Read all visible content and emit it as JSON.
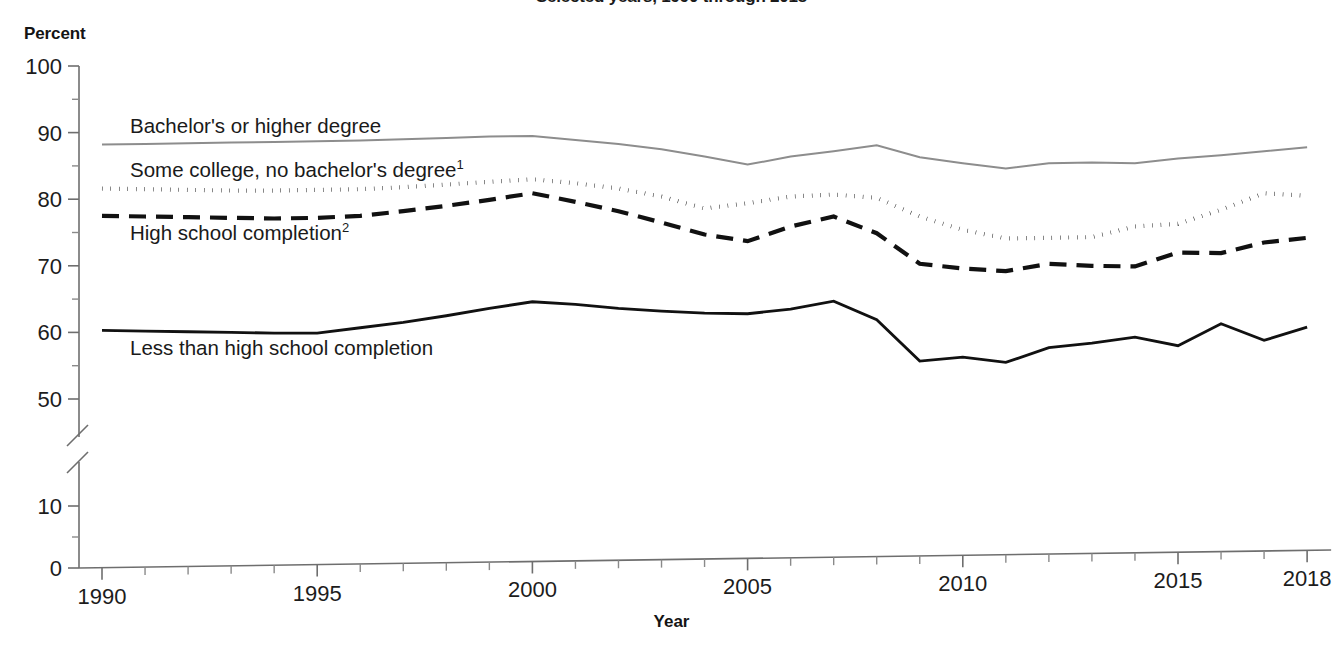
{
  "title": "Selected years, 1990 through 2018",
  "axis": {
    "y_unit_label": "Percent",
    "x_title": "Year",
    "y_ticks": [
      "100",
      "90",
      "80",
      "70",
      "60",
      "50",
      "10",
      "0"
    ],
    "x_ticks": [
      "1990",
      "1995",
      "2000",
      "2005",
      "2010",
      "2015",
      "2018"
    ],
    "y_axis_break": true
  },
  "series_labels": {
    "bachelors": "Bachelor's or higher degree",
    "some_college": "Some college, no bachelor's degree",
    "some_college_sup": "1",
    "high_school": "High school completion",
    "high_school_sup": "2",
    "less_than_hs": "Less than high school completion"
  },
  "colors": {
    "bachelors": "#8d8d8d",
    "some_college": "#111111",
    "high_school": "#111111",
    "less_than_hs": "#111111",
    "axis": "#6e6e6e",
    "text": "#1a1a1a",
    "background": "#ffffff"
  },
  "chart_data": {
    "type": "line",
    "title": "Selected years, 1990 through 2018",
    "xlabel": "Year",
    "ylabel": "Percent",
    "xlim": [
      1990,
      2018
    ],
    "ylim": [
      50,
      100
    ],
    "y_axis_break_between": [
      10,
      50
    ],
    "grid": false,
    "legend": "inline-labels",
    "x": [
      1990,
      1991,
      1992,
      1993,
      1994,
      1995,
      1996,
      1997,
      1998,
      1999,
      2000,
      2001,
      2002,
      2003,
      2004,
      2005,
      2006,
      2007,
      2008,
      2009,
      2010,
      2011,
      2012,
      2013,
      2014,
      2015,
      2016,
      2017,
      2018
    ],
    "series": [
      {
        "name": "Bachelor's or higher degree",
        "style": "solid-thin-gray",
        "values": [
          88.2,
          88.3,
          88.4,
          88.5,
          88.6,
          88.7,
          88.8,
          89.0,
          89.2,
          89.4,
          89.5,
          88.9,
          88.3,
          87.5,
          86.4,
          85.2,
          86.4,
          87.2,
          88.1,
          86.3,
          85.4,
          84.6,
          85.4,
          85.5,
          85.4,
          86.1,
          86.6,
          87.2,
          87.8
        ]
      },
      {
        "name": "Some college, no bachelor's degree",
        "style": "dotted",
        "values": [
          81.6,
          81.5,
          81.4,
          81.3,
          81.3,
          81.4,
          81.5,
          81.8,
          82.2,
          82.6,
          83.0,
          82.4,
          81.6,
          80.4,
          78.6,
          79.4,
          80.4,
          80.7,
          80.2,
          77.4,
          75.4,
          74.1,
          74.2,
          74.3,
          75.9,
          76.3,
          78.4,
          80.9,
          80.5
        ]
      },
      {
        "name": "High school completion",
        "style": "dashed",
        "values": [
          77.5,
          77.4,
          77.3,
          77.2,
          77.1,
          77.2,
          77.5,
          78.2,
          79.0,
          79.9,
          80.9,
          79.6,
          78.2,
          76.5,
          74.7,
          73.7,
          75.9,
          77.4,
          74.9,
          70.3,
          69.6,
          69.2,
          70.3,
          70.0,
          69.9,
          72.0,
          71.9,
          73.5,
          74.2
        ]
      },
      {
        "name": "Less than high school completion",
        "style": "solid-thick-black",
        "values": [
          60.3,
          60.2,
          60.1,
          60.0,
          59.9,
          59.9,
          60.7,
          61.5,
          62.5,
          63.6,
          64.6,
          64.2,
          63.6,
          63.2,
          62.9,
          62.8,
          63.5,
          64.7,
          61.9,
          55.7,
          56.3,
          55.5,
          57.7,
          58.4,
          59.3,
          58.0,
          61.3,
          58.8,
          60.8
        ]
      }
    ]
  }
}
